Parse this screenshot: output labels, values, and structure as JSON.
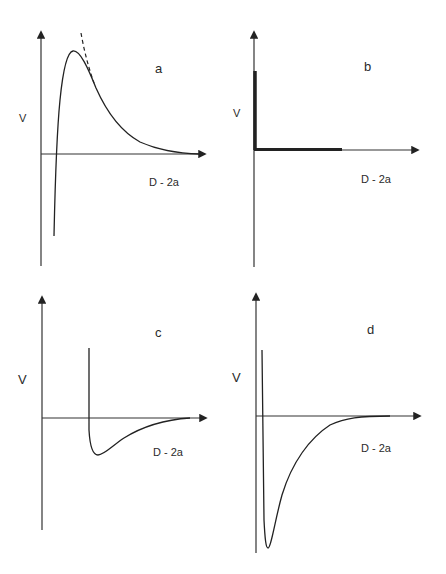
{
  "panels": [
    {
      "id": "a",
      "label": "a",
      "y_axis_label": "V",
      "x_axis_label": "D - 2a",
      "description": "Potential with sharp attractive well, strong repulsive barrier decaying to zero; dashed line shows pure repulsive asymptote"
    },
    {
      "id": "b",
      "label": "b",
      "y_axis_label": "V",
      "x_axis_label": "D - 2a",
      "description": "Hard-sphere-like potential: infinite wall at contact then zero (thick lines)"
    },
    {
      "id": "c",
      "label": "c",
      "y_axis_label": "V",
      "x_axis_label": "D - 2a",
      "description": "Hard wall at finite separation followed by shallow attractive well decaying to zero"
    },
    {
      "id": "d",
      "label": "d",
      "y_axis_label": "V",
      "x_axis_label": "D - 2a",
      "description": "Hard wall near origin followed by deep attractive well decaying to zero"
    }
  ],
  "colors": {
    "line": "#222222",
    "background": "#ffffff"
  }
}
